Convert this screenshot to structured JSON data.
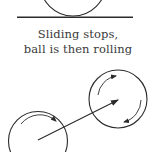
{
  "diagram": {
    "caption_line1": "Sliding stops,",
    "caption_line2": "ball is then rolling",
    "colors": {
      "stroke": "#2b2b2b",
      "text": "#3a3a3a",
      "background": "#ffffff"
    },
    "elements": {
      "top_ball": {
        "shape": "circle",
        "rests_on": "ground-line"
      },
      "ground_line": {
        "shape": "line"
      },
      "left_ball": {
        "shape": "circle",
        "rotation": "clockwise-arrow"
      },
      "right_ball": {
        "shape": "circle",
        "rotation": "clockwise-arrows"
      },
      "trajectory": {
        "shape": "arrow",
        "from": "left_ball",
        "to": "right_ball"
      }
    }
  }
}
